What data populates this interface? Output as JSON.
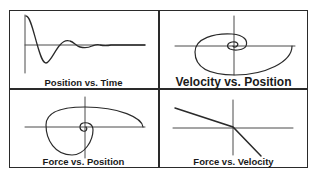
{
  "figure": {
    "panels": [
      {
        "id": "position-vs-time",
        "title": "Position vs. Time",
        "curve": "damped-oscillation"
      },
      {
        "id": "velocity-vs-position",
        "title": "Velocity vs. Position",
        "curve": "inward-spiral-phase-portrait"
      },
      {
        "id": "force-vs-position",
        "title": "Force vs. Position",
        "curve": "inward-spiral"
      },
      {
        "id": "force-vs-velocity",
        "title": "Force vs. Velocity",
        "curve": "piecewise-linear-decreasing"
      }
    ],
    "colors": {
      "line": "#2a2a2a",
      "axis": "#4a4a4a",
      "background": "#ffffff"
    }
  }
}
